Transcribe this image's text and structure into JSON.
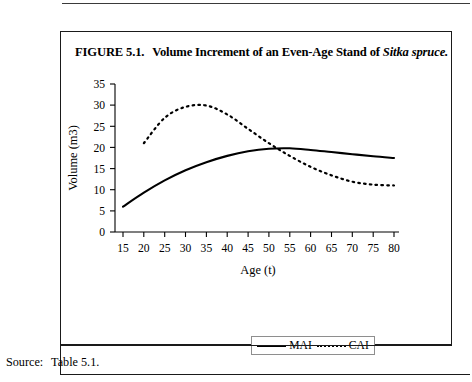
{
  "figure": {
    "caption_prefix": "FIGURE 5.1.",
    "caption_main": "Volume Increment of an Even-Age Stand of",
    "caption_italic": "Sitka spruce."
  },
  "source": {
    "label": "Source:",
    "value": "Table 5.1."
  },
  "legend": {
    "entries": [
      {
        "label": "MAI",
        "style": "solid"
      },
      {
        "label": "CAI",
        "style": "dotted"
      }
    ]
  },
  "chart_data": {
    "type": "line",
    "title": "Volume Increment of an Even-Age Stand of Sitka spruce.",
    "xlabel": "Age (t)",
    "ylabel": "Volume (m3)",
    "xlim": [
      15,
      80
    ],
    "ylim": [
      0,
      35
    ],
    "xticks": [
      15,
      20,
      25,
      30,
      35,
      40,
      45,
      50,
      55,
      60,
      65,
      70,
      75,
      80
    ],
    "yticks": [
      0,
      5,
      10,
      15,
      20,
      25,
      30,
      35
    ],
    "grid": false,
    "legend_position": "bottom-center",
    "series": [
      {
        "name": "MAI",
        "style": "solid",
        "x": [
          15,
          20,
          25,
          30,
          35,
          40,
          45,
          50,
          55,
          60,
          65,
          70,
          75,
          80
        ],
        "values": [
          6.0,
          9.3,
          12.2,
          14.6,
          16.5,
          18.0,
          19.1,
          19.7,
          19.8,
          19.4,
          18.9,
          18.4,
          17.9,
          17.5
        ]
      },
      {
        "name": "CAI",
        "style": "dotted",
        "x": [
          20,
          25,
          30,
          35,
          40,
          45,
          50,
          55,
          60,
          65,
          70,
          75,
          80
        ],
        "values": [
          21.0,
          27.0,
          29.6,
          29.9,
          27.8,
          24.4,
          21.0,
          18.0,
          15.4,
          13.4,
          11.9,
          11.2,
          11.0
        ]
      }
    ]
  }
}
